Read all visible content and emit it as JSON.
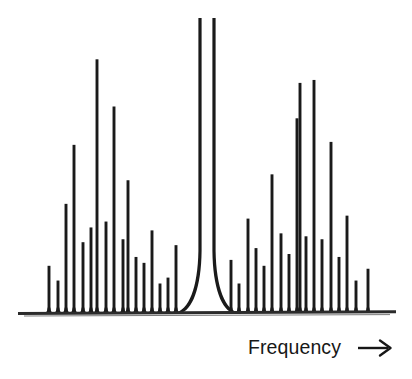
{
  "figure": {
    "title": "",
    "background_color": "#ffffff",
    "trace_color": "#1a1a1a",
    "baseline_color": "#2b2b2b"
  },
  "axis": {
    "x_label_text": "Frequency",
    "x_label_arrow": "arrow-right",
    "y_label_text": "",
    "baseline_y_px": 313,
    "x_start_px": 18,
    "x_end_px": 396
  },
  "chart_data": {
    "type": "bar",
    "title": "",
    "subtitle": "",
    "xlabel": "Frequency",
    "ylabel": "",
    "grid": false,
    "legend": null,
    "annotations": [],
    "xlim": [
      0,
      412
    ],
    "ylim": [
      0,
      100
    ],
    "carrier": {
      "x_px": 207,
      "value": 100,
      "clipped": true,
      "skirt_half_width_px": 26,
      "left_edge_x_px": 200,
      "right_edge_x_px": 214
    },
    "categories": [
      "L17",
      "L16",
      "L15",
      "L14",
      "L13",
      "L12",
      "L11",
      "L10",
      "L9",
      "L8",
      "L7",
      "L6",
      "L5",
      "L4",
      "L3",
      "L2",
      "L1",
      "C",
      "R1",
      "R2",
      "R3",
      "R4",
      "R5",
      "R6",
      "R7",
      "R8",
      "R9",
      "R10",
      "R11",
      "R12",
      "R13",
      "R14",
      "R15",
      "R16",
      "R17",
      "R18"
    ],
    "x": [
      49,
      58,
      66,
      74,
      83,
      91,
      97,
      106,
      114,
      123,
      128,
      136,
      144,
      152,
      160,
      168,
      176,
      207,
      231,
      239,
      248,
      256,
      264,
      272,
      281,
      289,
      297,
      300,
      306,
      314,
      322,
      331,
      339,
      347,
      356,
      368
    ],
    "values": [
      16,
      11,
      37,
      57,
      24,
      29,
      86,
      31,
      70,
      25,
      45,
      19,
      17,
      28,
      10,
      12,
      23,
      100,
      18,
      10,
      32,
      22,
      16,
      47,
      27,
      20,
      66,
      78,
      26,
      79,
      25,
      58,
      19,
      33,
      11,
      15
    ],
    "series": [
      {
        "name": "Spectrum amplitude",
        "values": [
          16,
          11,
          37,
          57,
          24,
          29,
          86,
          31,
          70,
          25,
          45,
          19,
          17,
          28,
          10,
          12,
          23,
          100,
          18,
          10,
          32,
          22,
          16,
          47,
          27,
          20,
          66,
          78,
          26,
          79,
          25,
          58,
          19,
          33,
          11,
          15
        ]
      }
    ]
  }
}
